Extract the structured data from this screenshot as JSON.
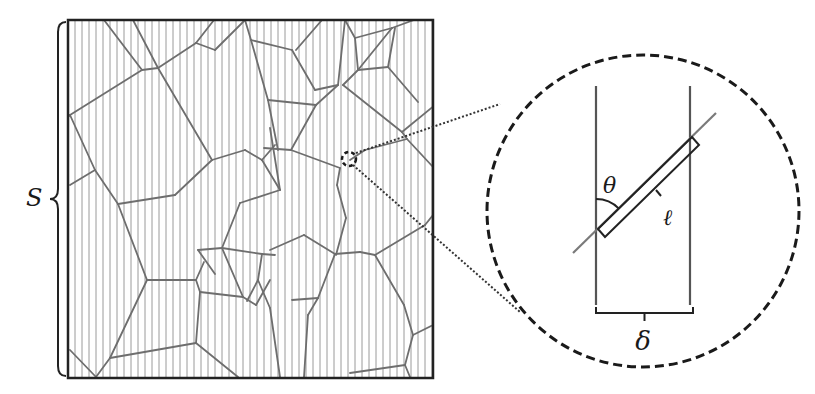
{
  "figure": {
    "width": 815,
    "height": 394,
    "colors": {
      "background": "#ffffff",
      "frame": "#222222",
      "hatch": "#9a9a9a",
      "cell_edges": "#6e6e6e",
      "zoom_circle": "#1a1a1a",
      "leader_lines": "#333333",
      "label": "#1a1a1a"
    }
  },
  "labels": {
    "domain_size": "S",
    "angle": "θ",
    "segment_length": "ℓ",
    "line_spacing": "δ"
  },
  "panel": {
    "frame": {
      "x": 68,
      "y": 20,
      "w": 365,
      "h": 358
    },
    "hatch_spacing": 7,
    "brace": {
      "x": 58,
      "y1": 22,
      "y2": 376
    },
    "magnifier_marker": {
      "cx": 349,
      "cy": 159,
      "r": 7
    },
    "cell_edges": [
      [
        [
          104,
          20
        ],
        [
          142,
          70
        ]
      ],
      [
        [
          133,
          20
        ],
        [
          158,
          68
        ]
      ],
      [
        [
          142,
          70
        ],
        [
          158,
          68
        ]
      ],
      [
        [
          142,
          70
        ],
        [
          70,
          115
        ]
      ],
      [
        [
          158,
          68
        ],
        [
          196,
          43
        ]
      ],
      [
        [
          196,
          43
        ],
        [
          215,
          50
        ]
      ],
      [
        [
          196,
          43
        ],
        [
          214,
          20
        ]
      ],
      [
        [
          215,
          50
        ],
        [
          245,
          20
        ]
      ],
      [
        [
          158,
          68
        ],
        [
          212,
          160
        ]
      ],
      [
        [
          212,
          160
        ],
        [
          245,
          150
        ]
      ],
      [
        [
          70,
          115
        ],
        [
          95,
          170
        ]
      ],
      [
        [
          95,
          170
        ],
        [
          70,
          185
        ]
      ],
      [
        [
          95,
          170
        ],
        [
          118,
          204
        ]
      ],
      [
        [
          118,
          204
        ],
        [
          175,
          195
        ]
      ],
      [
        [
          175,
          195
        ],
        [
          212,
          160
        ]
      ],
      [
        [
          70,
          115
        ],
        [
          68,
          117
        ]
      ],
      [
        [
          245,
          150
        ],
        [
          262,
          160
        ]
      ],
      [
        [
          262,
          160
        ],
        [
          280,
          190
        ]
      ],
      [
        [
          262,
          160
        ],
        [
          275,
          145
        ]
      ],
      [
        [
          245,
          20
        ],
        [
          251,
          40
        ]
      ],
      [
        [
          251,
          40
        ],
        [
          292,
          50
        ]
      ],
      [
        [
          251,
          40
        ],
        [
          268,
          100
        ]
      ],
      [
        [
          268,
          100
        ],
        [
          278,
          150
        ]
      ],
      [
        [
          292,
          50
        ],
        [
          315,
          90
        ]
      ],
      [
        [
          268,
          100
        ],
        [
          316,
          105
        ]
      ],
      [
        [
          316,
          105
        ],
        [
          338,
          85
        ]
      ],
      [
        [
          338,
          85
        ],
        [
          315,
          90
        ]
      ],
      [
        [
          338,
          85
        ],
        [
          345,
          20
        ]
      ],
      [
        [
          296,
          50
        ],
        [
          322,
          20
        ]
      ],
      [
        [
          345,
          20
        ],
        [
          355,
          38
        ]
      ],
      [
        [
          355,
          38
        ],
        [
          392,
          28
        ]
      ],
      [
        [
          392,
          28
        ],
        [
          414,
          20
        ]
      ],
      [
        [
          392,
          28
        ],
        [
          358,
          70
        ]
      ],
      [
        [
          358,
          70
        ],
        [
          388,
          67
        ]
      ],
      [
        [
          388,
          67
        ],
        [
          418,
          102
        ]
      ],
      [
        [
          388,
          67
        ],
        [
          395,
          28
        ]
      ],
      [
        [
          355,
          38
        ],
        [
          358,
          70
        ]
      ],
      [
        [
          358,
          70
        ],
        [
          343,
          85
        ]
      ],
      [
        [
          343,
          85
        ],
        [
          402,
          132
        ]
      ],
      [
        [
          402,
          132
        ],
        [
          435,
          105
        ]
      ],
      [
        [
          402,
          132
        ],
        [
          407,
          139
        ]
      ],
      [
        [
          407,
          139
        ],
        [
          433,
          167
        ]
      ],
      [
        [
          407,
          139
        ],
        [
          365,
          150
        ]
      ],
      [
        [
          365,
          150
        ],
        [
          350,
          160
        ]
      ],
      [
        [
          316,
          105
        ],
        [
          291,
          150
        ]
      ],
      [
        [
          291,
          150
        ],
        [
          340,
          168
        ]
      ],
      [
        [
          291,
          150
        ],
        [
          264,
          148
        ]
      ],
      [
        [
          340,
          168
        ],
        [
          337,
          185
        ]
      ],
      [
        [
          337,
          185
        ],
        [
          346,
          218
        ]
      ],
      [
        [
          346,
          218
        ],
        [
          336,
          255
        ]
      ],
      [
        [
          270,
          128
        ],
        [
          280,
          190
        ]
      ],
      [
        [
          280,
          190
        ],
        [
          240,
          203
        ]
      ],
      [
        [
          240,
          203
        ],
        [
          222,
          248
        ]
      ],
      [
        [
          222,
          248
        ],
        [
          198,
          250
        ]
      ],
      [
        [
          198,
          250
        ],
        [
          215,
          274
        ]
      ],
      [
        [
          118,
          204
        ],
        [
          147,
          280
        ]
      ],
      [
        [
          147,
          280
        ],
        [
          196,
          280
        ]
      ],
      [
        [
          196,
          280
        ],
        [
          204,
          262
        ]
      ],
      [
        [
          196,
          280
        ],
        [
          200,
          292
        ]
      ],
      [
        [
          200,
          292
        ],
        [
          243,
          297
        ]
      ],
      [
        [
          243,
          297
        ],
        [
          256,
          305
        ]
      ],
      [
        [
          256,
          305
        ],
        [
          270,
          280
        ]
      ],
      [
        [
          200,
          292
        ],
        [
          196,
          343
        ]
      ],
      [
        [
          196,
          343
        ],
        [
          110,
          358
        ]
      ],
      [
        [
          110,
          358
        ],
        [
          147,
          280
        ]
      ],
      [
        [
          70,
          350
        ],
        [
          96,
          377
        ]
      ],
      [
        [
          96,
          377
        ],
        [
          110,
          358
        ]
      ],
      [
        [
          196,
          343
        ],
        [
          238,
          377
        ]
      ],
      [
        [
          243,
          297
        ],
        [
          222,
          248
        ]
      ],
      [
        [
          222,
          248
        ],
        [
          262,
          254
        ]
      ],
      [
        [
          262,
          254
        ],
        [
          275,
          255
        ]
      ],
      [
        [
          270,
          250
        ],
        [
          304,
          235
        ]
      ],
      [
        [
          304,
          235
        ],
        [
          335,
          254
        ]
      ],
      [
        [
          335,
          254
        ],
        [
          360,
          252
        ]
      ],
      [
        [
          360,
          252
        ],
        [
          375,
          255
        ]
      ],
      [
        [
          375,
          255
        ],
        [
          425,
          225
        ]
      ],
      [
        [
          425,
          225
        ],
        [
          433,
          215
        ]
      ],
      [
        [
          335,
          254
        ],
        [
          318,
          298
        ]
      ],
      [
        [
          318,
          298
        ],
        [
          308,
          315
        ]
      ],
      [
        [
          308,
          315
        ],
        [
          304,
          377
        ]
      ],
      [
        [
          375,
          255
        ],
        [
          404,
          305
        ]
      ],
      [
        [
          404,
          305
        ],
        [
          413,
          335
        ]
      ],
      [
        [
          413,
          335
        ],
        [
          433,
          325
        ]
      ],
      [
        [
          413,
          335
        ],
        [
          405,
          365
        ]
      ],
      [
        [
          405,
          365
        ],
        [
          350,
          373
        ]
      ],
      [
        [
          405,
          365
        ],
        [
          410,
          377
        ]
      ],
      [
        [
          262,
          254
        ],
        [
          258,
          280
        ]
      ],
      [
        [
          258,
          280
        ],
        [
          270,
          308
        ]
      ],
      [
        [
          270,
          308
        ],
        [
          280,
          377
        ]
      ],
      [
        [
          258,
          280
        ],
        [
          247,
          301
        ]
      ],
      [
        [
          318,
          298
        ],
        [
          292,
          300
        ]
      ]
    ],
    "leader_lines": [
      [
        [
          356,
          153
        ],
        [
          500,
          104
        ]
      ],
      [
        [
          353,
          165
        ],
        [
          520,
          312
        ]
      ]
    ]
  },
  "inset": {
    "circle": {
      "cx": 643,
      "cy": 211,
      "r": 156
    },
    "left_line_x": 596,
    "right_line_x": 690,
    "lines_y1": 86,
    "lines_y2": 305,
    "diag_line": {
      "x1": 573,
      "y1": 253,
      "x2": 716,
      "y2": 113
    },
    "segment_box": [
      [
        598,
        229
      ],
      [
        692,
        137
      ],
      [
        699,
        145
      ],
      [
        605,
        237
      ]
    ],
    "tick": {
      "x1": 656,
      "y1": 190,
      "x2": 661,
      "y2": 196
    },
    "angle_arc": {
      "cx": 596,
      "cy": 231,
      "r": 32
    },
    "theta_pos": {
      "x": 603,
      "y": 193
    },
    "ell_pos": {
      "x": 663,
      "y": 225
    },
    "delta_brace": {
      "x1": 596,
      "x2": 693,
      "y": 313,
      "tip_y": 325
    },
    "delta_pos": {
      "x": 643,
      "y": 350
    },
    "S_pos": {
      "x": 26,
      "y": 206
    }
  }
}
